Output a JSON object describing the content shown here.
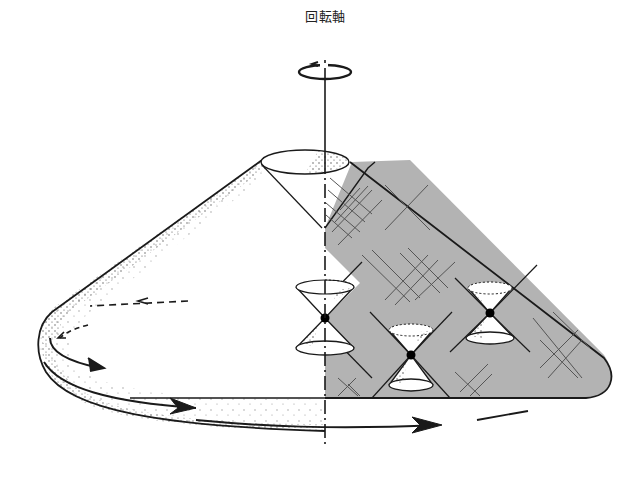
{
  "diagram": {
    "title": "",
    "labels": {
      "rotation_axis": "回転軸"
    },
    "colors": {
      "background": "#ffffff",
      "ink": "#1a1a1a",
      "shaded_region": "#b3b3b3",
      "light_cone_fill": "#ffffff"
    },
    "elements": [
      {
        "type": "truncated-cone",
        "description": "cone surface with stippled left flank"
      },
      {
        "type": "axis",
        "style": "dash-dot vertical",
        "label_ref": "rotation_axis"
      },
      {
        "type": "rotation-arrow",
        "description": "circular arrow around axis top"
      },
      {
        "type": "shaded-strip",
        "description": "unrolled gray region on right half with cross-hatching"
      },
      {
        "type": "light-cone",
        "count": 3,
        "description": "hourglass light cones with black apex dots"
      },
      {
        "type": "spiral-path",
        "description": "arrowed curve winding around cone base, dashed on back side"
      }
    ]
  }
}
